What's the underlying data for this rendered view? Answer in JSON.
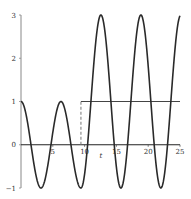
{
  "chart_data": {
    "type": "line",
    "title": "",
    "xlabel": "t",
    "ylabel": "",
    "xlim": [
      0,
      25
    ],
    "ylim": [
      -1,
      3
    ],
    "grid": false,
    "x_ticks": [
      "5",
      "10",
      "15",
      "20",
      "25"
    ],
    "y_ticks": [
      "-1",
      "0",
      "1",
      "2",
      "3"
    ],
    "series": [
      {
        "name": "response",
        "expression": "cos(t) for t<3π; 1+2cos(t) for t≥3π",
        "color": "#333333"
      },
      {
        "name": "step input",
        "expression": "0 for t<3π; 1 for t≥3π",
        "color": "#555555",
        "style": "dashed vertical at t≈9.42, solid at y=1"
      }
    ],
    "samples": {
      "x": [
        0,
        1.57,
        3.14,
        4.71,
        6.28,
        7.85,
        9.42,
        10.99,
        12.57,
        14.14,
        15.71,
        17.28,
        18.85,
        20.42,
        21.99,
        23.56,
        25
      ],
      "y": [
        1,
        0,
        -1,
        0,
        1,
        0,
        -1,
        1,
        3,
        1,
        -1,
        1,
        3,
        1,
        -1,
        1,
        2.98
      ]
    }
  }
}
